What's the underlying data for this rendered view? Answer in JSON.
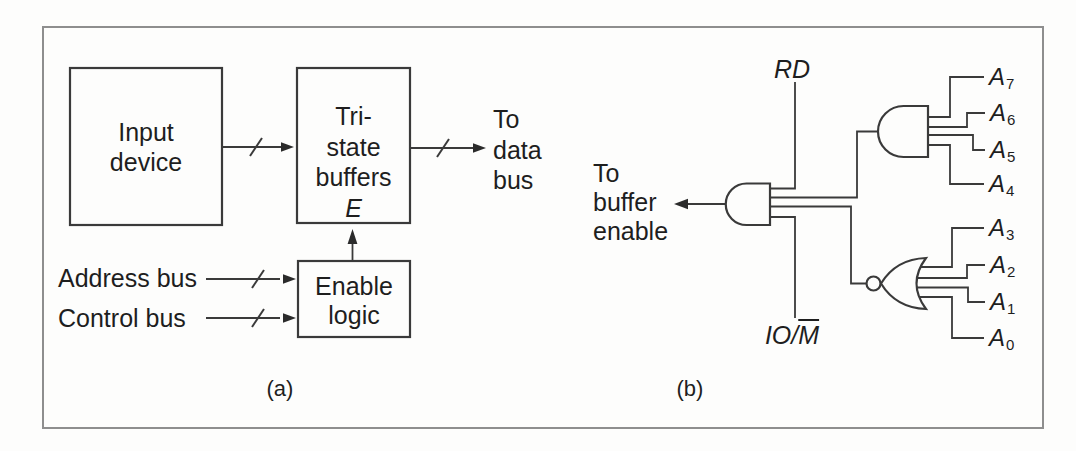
{
  "figure": {
    "caption_a": "(a)",
    "caption_b": "(b)"
  },
  "panel_a": {
    "input_device_box": {
      "line1": "Input",
      "line2": "device"
    },
    "tristate_box": {
      "line1": "Tri-",
      "line2": "state",
      "line3": "buffers",
      "enable_pin": "E"
    },
    "enable_logic_box": {
      "line1": "Enable",
      "line2": "logic"
    },
    "to_data_bus": {
      "line1": "To",
      "line2": "data",
      "line3": "bus"
    },
    "address_bus_label": "Address bus",
    "control_bus_label": "Control bus"
  },
  "panel_b": {
    "rd_label": "RD",
    "iom_label": {
      "prefix": "IO/",
      "overlined": "M"
    },
    "output_label": {
      "line1": "To",
      "line2": "buffer",
      "line3": "enable"
    },
    "address_lines": [
      {
        "base": "A",
        "sub": "7"
      },
      {
        "base": "A",
        "sub": "6"
      },
      {
        "base": "A",
        "sub": "5"
      },
      {
        "base": "A",
        "sub": "4"
      },
      {
        "base": "A",
        "sub": "3"
      },
      {
        "base": "A",
        "sub": "2"
      },
      {
        "base": "A",
        "sub": "1"
      },
      {
        "base": "A",
        "sub": "0"
      }
    ]
  },
  "colors": {
    "line": "#3a3a3a",
    "text": "#1e1e1e",
    "frame": "#8e8e8e",
    "background": "#fdfdfc"
  }
}
